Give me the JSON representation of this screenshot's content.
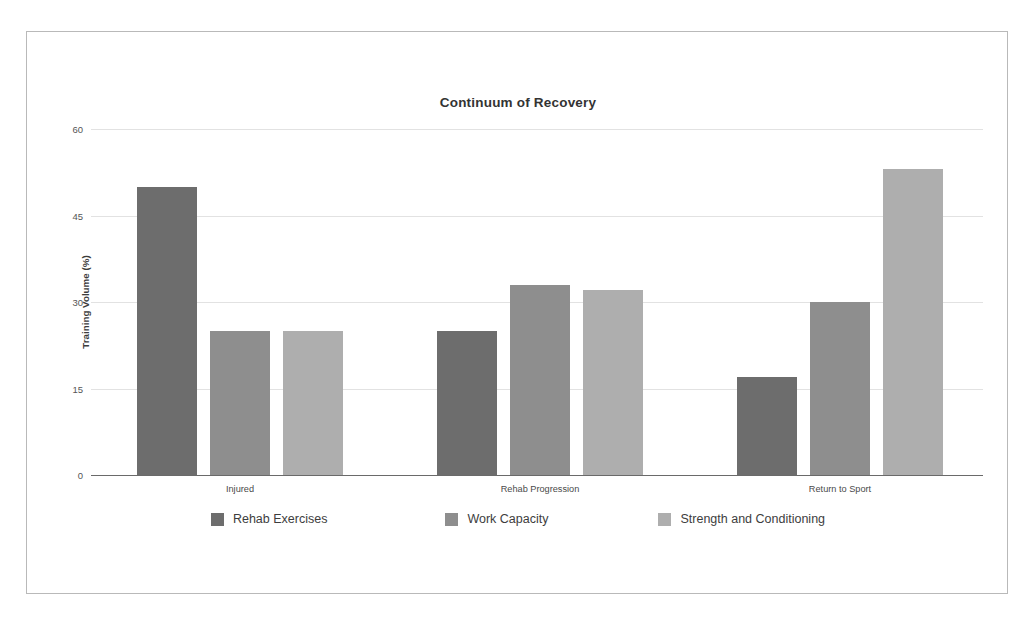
{
  "chart_data": {
    "type": "bar",
    "title": "Continuum of Recovery",
    "xlabel": "",
    "ylabel": "Training Volume (%)",
    "categories": [
      "Injured",
      "Rehab Progression",
      "Return to Sport"
    ],
    "series": [
      {
        "name": "Rehab Exercises",
        "color": "#6d6d6d",
        "values": [
          50,
          25,
          17
        ]
      },
      {
        "name": "Work Capacity",
        "color": "#8e8e8e",
        "values": [
          25,
          33,
          30
        ]
      },
      {
        "name": "Strength and Conditioning",
        "color": "#aeaeae",
        "values": [
          25,
          32,
          53
        ]
      }
    ],
    "ylim": [
      0,
      60
    ],
    "yticks": [
      0,
      15,
      30,
      45,
      60
    ],
    "ytick_labels": [
      "0",
      "15",
      "30",
      "45",
      "60"
    ],
    "grid": true,
    "legend_position": "bottom"
  },
  "style": {
    "grid_color": "#e2e2e2",
    "axis_color": "#6a6a6a",
    "frame_color": "#b9b9b9",
    "title_color": "#333333",
    "background": "#ffffff"
  }
}
